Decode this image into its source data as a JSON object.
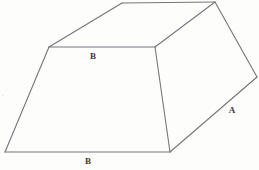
{
  "figure": {
    "kind": "geometric-line-drawing",
    "canvas": {
      "width": 259,
      "height": 170
    },
    "background_color": "#fdfdfc",
    "line_color": "#76767a",
    "label_color": "#3a3a3c",
    "vertices": {
      "front_bottom_left": {
        "x": 5,
        "y": 152
      },
      "front_bottom_right": {
        "x": 170,
        "y": 152
      },
      "front_top_right": {
        "x": 155,
        "y": 47
      },
      "front_top_left": {
        "x": 49,
        "y": 47
      },
      "back_top_left": {
        "x": 122,
        "y": 3
      },
      "back_top_right": {
        "x": 215,
        "y": 2
      },
      "right_bottom_back": {
        "x": 257,
        "y": 77
      }
    },
    "faces": [
      {
        "name": "front-face",
        "shape": "trapezoid",
        "points": "5,152 170,152 155,47 49,47"
      },
      {
        "name": "top-face",
        "shape": "parallelogram",
        "points": "49,47 155,47 215,2 122,3"
      },
      {
        "name": "right-face",
        "shape": "parallelogram",
        "points": "155,47 215,2 257,77 170,152"
      }
    ],
    "edges": [
      {
        "name": "front-bottom-edge",
        "from": "front_bottom_left",
        "to": "front_bottom_right"
      },
      {
        "name": "front-left-edge",
        "from": "front_bottom_left",
        "to": "front_top_left"
      },
      {
        "name": "front-top-edge",
        "from": "front_top_left",
        "to": "front_top_right"
      },
      {
        "name": "front-right-edge",
        "from": "front_top_right",
        "to": "front_bottom_right"
      },
      {
        "name": "top-back-left-edge",
        "from": "front_top_left",
        "to": "back_top_left"
      },
      {
        "name": "top-back-edge",
        "from": "back_top_left",
        "to": "back_top_right"
      },
      {
        "name": "top-right-edge",
        "from": "front_top_right",
        "to": "back_top_right"
      },
      {
        "name": "right-back-edge",
        "from": "back_top_right",
        "to": "right_bottom_back"
      },
      {
        "name": "right-bottom-edge",
        "from": "right_bottom_back",
        "to": "front_bottom_right"
      }
    ]
  },
  "labels": [
    {
      "id": "label-b-top",
      "text": "B",
      "x": 93,
      "y": 56,
      "face": "top-face"
    },
    {
      "id": "label-b-bottom",
      "text": "B",
      "x": 88,
      "y": 161,
      "face": "front-face"
    },
    {
      "id": "label-a-right",
      "text": "A",
      "x": 232,
      "y": 110,
      "face": "right-face"
    }
  ],
  "marks": [
    {
      "id": "left-margin-mark",
      "text": "·",
      "x": 3,
      "y": 96
    }
  ]
}
